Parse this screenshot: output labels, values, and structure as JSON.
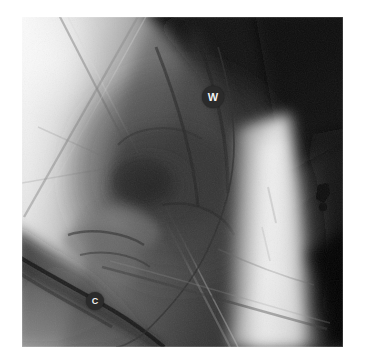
{
  "image": {
    "kind": "fluoroscopic-radiograph",
    "region": "hip",
    "background_color": "#ffffff",
    "frame": {
      "left": 22,
      "top": 17,
      "width": 321,
      "height": 330
    },
    "tone_scale": {
      "darkest": "#050505",
      "dark": "#1d1d1d",
      "mid_dark": "#3c3c3c",
      "mid": "#6a6a6a",
      "mid_light": "#9a9a9a",
      "light": "#c8c8c8",
      "brightest": "#f4f4f4"
    }
  },
  "annotations": {
    "markers": [
      {
        "id": "w",
        "label": "W",
        "shape": "filled-circle",
        "fill_color": "#2b2b2b",
        "text_color": "#f2f2f2",
        "center_x": 213,
        "center_y": 97,
        "diameter": 22
      },
      {
        "id": "c",
        "label": "C",
        "shape": "filled-circle",
        "fill_color": "#2b2b2b",
        "text_color": "#f2f2f2",
        "center_x": 95,
        "center_y": 301,
        "diameter": 18
      }
    ]
  },
  "features": {
    "drape_lines": "crossing straight radiolucent drape/sheet edges across upper-left quadrant",
    "guidewire": "thin dark wire descending through the W marker toward the joint",
    "catheter": "dark tubular catheter running diagonally from lower-left through the C marker",
    "bright_band": "high-density vertical band along the right half of the field",
    "metal_object": "small dense metallic object at right edge of the field",
    "soft_tissue_dark": "dark soft-tissue / off-field regions at upper-right and lower-right corners"
  }
}
